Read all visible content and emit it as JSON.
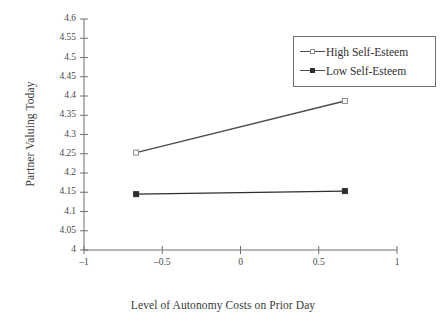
{
  "chart_data": {
    "type": "line",
    "title": "",
    "xlabel": "Level of Autonomy Costs on Prior Day",
    "ylabel": "Partner Valuing Today",
    "xlim": [
      -1,
      1
    ],
    "ylim": [
      4,
      4.6
    ],
    "xticks": [
      -1,
      -0.5,
      0,
      0.5,
      1
    ],
    "xtick_labels": [
      "–1",
      "–0.5",
      "0",
      "0.5",
      "1"
    ],
    "yticks": [
      4,
      4.05,
      4.1,
      4.15,
      4.2,
      4.25,
      4.3,
      4.35,
      4.4,
      4.45,
      4.5,
      4.55,
      4.6
    ],
    "ytick_labels": [
      "4",
      "4.05",
      "4.1",
      "4.15",
      "4.2",
      "4.25",
      "4.3",
      "4.35",
      "4.4",
      "4.45",
      "4.5",
      "4.55",
      "4.6"
    ],
    "grid": false,
    "legend_position": "top-right",
    "x": [
      -0.667,
      0.667
    ],
    "series": [
      {
        "name": "High Self-Esteem",
        "values": [
          4.253,
          4.387
        ],
        "marker": "open-square",
        "color": "#4c4c4c"
      },
      {
        "name": "Low Self-Esteem",
        "values": [
          4.145,
          4.153
        ],
        "marker": "filled-square",
        "color": "#2e2e2e"
      }
    ]
  },
  "legend": {
    "items": [
      {
        "label": "High Self-Esteem",
        "marker": "open-square-marker"
      },
      {
        "label": "Low Self-Esteem",
        "marker": "filled-square-marker"
      }
    ]
  },
  "axes": {
    "y_title": "Partner Valuing Today",
    "x_title": "Level of Autonomy Costs on Prior Day"
  },
  "colors": {
    "background": "#ffffff",
    "axis": "#6f6f6f",
    "text": "#3a3a3a",
    "high_series": "#4c4c4c",
    "low_series": "#2e2e2e"
  }
}
